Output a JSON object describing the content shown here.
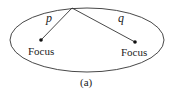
{
  "diagram": {
    "type": "ellipse-foci",
    "stroke_color": "#333333",
    "segment_labels": {
      "left": "p",
      "right": "q"
    },
    "foci_labels": {
      "left": "Focus",
      "right": "Focus"
    },
    "caption": "(a)"
  }
}
